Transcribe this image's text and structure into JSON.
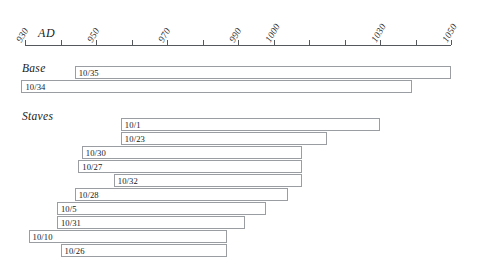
{
  "chart_data": {
    "type": "bar",
    "title": "",
    "subtitle": "",
    "xlabel": "AD",
    "ylabel": "",
    "orientation": "horizontal",
    "style": "gantt-range-bars",
    "grid": false,
    "legend": "none",
    "xlim": [
      930,
      1050
    ],
    "axis": {
      "unit_label": "AD",
      "tick_values": [
        930,
        940,
        950,
        960,
        970,
        980,
        990,
        1000,
        1010,
        1020,
        1030,
        1040,
        1050
      ],
      "labeled_ticks": [
        930,
        950,
        970,
        990,
        1000,
        1030,
        1050
      ],
      "tick_labels": [
        "930",
        "950",
        "970",
        "990",
        "1000",
        "1030",
        "1050"
      ],
      "label_rotation_deg": -60
    },
    "groups": [
      {
        "name": "Base",
        "bars": [
          {
            "label": "10/35",
            "start": 944,
            "end": 1050
          },
          {
            "label": "10/34",
            "start": 929,
            "end": 1039
          }
        ]
      },
      {
        "name": "Staves",
        "bars": [
          {
            "label": "10/1",
            "start": 957,
            "end": 1030
          },
          {
            "label": "10/23",
            "start": 957,
            "end": 1015
          },
          {
            "label": "10/30",
            "start": 946,
            "end": 1008
          },
          {
            "label": "10/27",
            "start": 945,
            "end": 1008
          },
          {
            "label": "10/32",
            "start": 955,
            "end": 1008
          },
          {
            "label": "10/28",
            "start": 944,
            "end": 1004
          },
          {
            "label": "10/5",
            "start": 939,
            "end": 998
          },
          {
            "label": "10/31",
            "start": 939,
            "end": 992
          },
          {
            "label": "10/10",
            "start": 931,
            "end": 987
          },
          {
            "label": "10/26",
            "start": 940,
            "end": 987
          }
        ]
      }
    ],
    "colors": {
      "bar_fill": "#ffffff",
      "bar_stroke": "#9a9da1",
      "axis": "#55585c",
      "text": "#1a1a1a",
      "background": "#ffffff"
    }
  },
  "layout": {
    "axis_px_left": 25,
    "axis_px_right": 451,
    "base_group_top_px": 62,
    "base_rows_top_px": 66,
    "staves_group_top_px": 110,
    "staves_rows_top_px": 118,
    "row_pitch_px": 14,
    "bar_height_px": 13
  }
}
